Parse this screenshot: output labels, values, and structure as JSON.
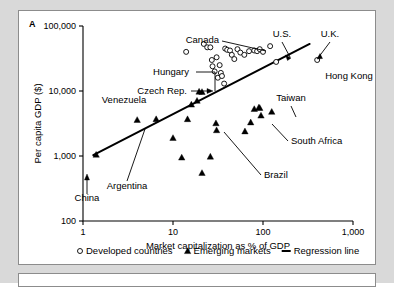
{
  "panel": {
    "label": "A"
  },
  "chart_data": {
    "type": "scatter",
    "title": "",
    "xlabel": "Market capitalization as % of GDP",
    "ylabel": "Per capita GDP ($)",
    "xscale": "log",
    "yscale": "log",
    "xlim": [
      1,
      1000
    ],
    "ylim": [
      100,
      100000
    ],
    "xticks": [
      "1",
      "10",
      "100",
      "1,000"
    ],
    "xtick_values": [
      1,
      10,
      100,
      1000
    ],
    "yticks": [
      "100",
      "1,000",
      "10,000",
      "100,000"
    ],
    "ytick_values": [
      100,
      1000,
      10000,
      100000
    ],
    "grid": false,
    "legend_position": "below-axis",
    "series": [
      {
        "name": "Developed countries",
        "marker": "open-circle",
        "points": [
          [
            14.0,
            40000
          ],
          [
            22.0,
            53000
          ],
          [
            24.0,
            47000
          ],
          [
            26.0,
            47000
          ],
          [
            27.5,
            24000
          ],
          [
            27.0,
            30000
          ],
          [
            29.0,
            20000
          ],
          [
            30.5,
            33000
          ],
          [
            31.5,
            16000
          ],
          [
            33.0,
            25000
          ],
          [
            34.0,
            19000
          ],
          [
            35.0,
            17000
          ],
          [
            37.0,
            13000
          ],
          [
            38.0,
            45000
          ],
          [
            40.0,
            43000
          ],
          [
            43.0,
            42000
          ],
          [
            45.0,
            36000
          ],
          [
            48.0,
            31000
          ],
          [
            52.0,
            44000
          ],
          [
            56.0,
            39000
          ],
          [
            62.0,
            36000
          ],
          [
            70.0,
            41000
          ],
          [
            80.0,
            42000
          ],
          [
            86.0,
            41000
          ],
          [
            92.0,
            44000
          ],
          [
            100.0,
            40000
          ],
          [
            120.0,
            49000
          ],
          [
            140.0,
            28000
          ],
          [
            400.0,
            30000
          ]
        ]
      },
      {
        "name": "Emerging markets",
        "marker": "filled-triangle",
        "points": [
          [
            1.4,
            1050
          ],
          [
            4.0,
            3600
          ],
          [
            6.5,
            3700
          ],
          [
            10.0,
            1900
          ],
          [
            12.5,
            950
          ],
          [
            14.5,
            3700
          ],
          [
            16.0,
            6200
          ],
          [
            18.5,
            7100
          ],
          [
            19.5,
            9800
          ],
          [
            21.0,
            9700
          ],
          [
            21.0,
            550
          ],
          [
            26.0,
            980
          ],
          [
            30.0,
            3200
          ],
          [
            30.5,
            2500
          ],
          [
            63.0,
            2400
          ],
          [
            73.0,
            3300
          ],
          [
            80.0,
            5300
          ],
          [
            90.0,
            5600
          ],
          [
            92.0,
            5500
          ],
          [
            95.0,
            4200
          ],
          [
            125.0,
            4800
          ]
        ]
      }
    ],
    "regression_line": {
      "name": "Regression line",
      "start": [
        1.3,
        1030
      ],
      "end": [
        330.0,
        53000
      ]
    },
    "annotations": [
      {
        "text": "Canada",
        "x": 200,
        "y": 32,
        "anchor": "end",
        "leader": true
      },
      {
        "text": "U.S.",
        "x": 263,
        "y": 26,
        "anchor": "middle",
        "leader": true
      },
      {
        "text": "U.K.",
        "x": 311,
        "y": 26,
        "anchor": "middle",
        "leader": true
      },
      {
        "text": "Hong Kong",
        "x": 330,
        "y": 68,
        "anchor": "middle",
        "leader": false
      },
      {
        "text": "Hungary",
        "x": 170,
        "y": 64,
        "anchor": "end",
        "leader": true
      },
      {
        "text": "Czech Rep.",
        "x": 168,
        "y": 83,
        "anchor": "end",
        "leader": true
      },
      {
        "text": "Venezuela",
        "x": 105,
        "y": 92,
        "anchor": "middle",
        "leader": false
      },
      {
        "text": "Taiwan",
        "x": 272,
        "y": 90,
        "anchor": "middle",
        "leader": true
      },
      {
        "text": "South Africa",
        "x": 272,
        "y": 133,
        "anchor": "start",
        "leader": true
      },
      {
        "text": "Brazil",
        "x": 245,
        "y": 167,
        "anchor": "start",
        "leader": true
      },
      {
        "text": "Argentina",
        "x": 108,
        "y": 178,
        "anchor": "middle",
        "leader": true
      },
      {
        "text": "China",
        "x": 68,
        "y": 190,
        "anchor": "middle",
        "leader": true
      }
    ]
  },
  "legend": {
    "items": [
      {
        "marker": "open-circle",
        "label": "Developed countries"
      },
      {
        "marker": "filled-triangle",
        "label": "Emerging markets"
      },
      {
        "marker": "line",
        "label": "Regression line"
      }
    ]
  }
}
